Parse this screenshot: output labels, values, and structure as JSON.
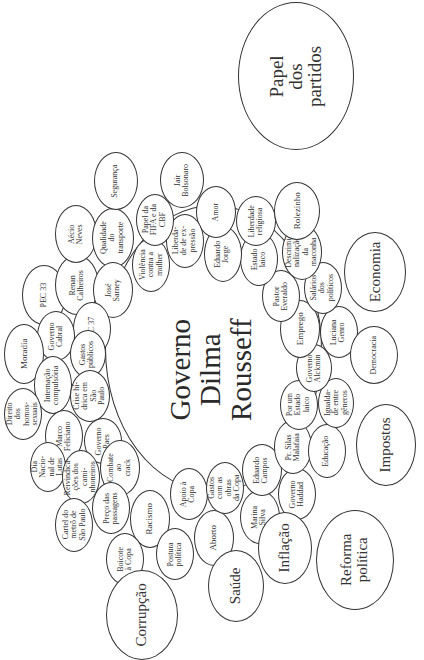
{
  "diagram": {
    "orientation": "rotated -90deg (text reads bottom to top)",
    "center": {
      "label": "Governo\nDilma Rousseff"
    },
    "inner_ring": [
      {
        "id": "pec33",
        "label": "PEC 33"
      },
      {
        "id": "renan",
        "label": "Renan\nCalheiros"
      },
      {
        "id": "aecio",
        "label": "Aécio\nNeves"
      },
      {
        "id": "qualidade",
        "label": "Qualidade do\ntransporte"
      },
      {
        "id": "seguranca",
        "label": "Segurança"
      },
      {
        "id": "jose-sarney",
        "label": "José\nSarney"
      },
      {
        "id": "pec37",
        "label": "PEC 37"
      },
      {
        "id": "governo-cabral",
        "label": "Governo\nCabral"
      },
      {
        "id": "moradia",
        "label": "Moradia"
      },
      {
        "id": "gastos-publicos",
        "label": "Gastos\npúblicos"
      },
      {
        "id": "internacao",
        "label": "Internação\ncompulsória"
      },
      {
        "id": "direito-homo",
        "label": "Direito\ndos homos-\nsexuais"
      },
      {
        "id": "crise-hidrica",
        "label": "Crise hí-\ndrica em São\nPaulo"
      },
      {
        "id": "marco-feliciano",
        "label": "Marco\nFeliciano"
      },
      {
        "id": "governo-paes",
        "label": "Governo\nPaes"
      },
      {
        "id": "dia-nacional",
        "label": "Dia Nacio-\nnal de Lutas"
      },
      {
        "id": "reivindicacoes",
        "label": "Reivindica-\nções dos cami-\nnhoneiros"
      },
      {
        "id": "combate-crack",
        "label": "Combate ao\ncrack"
      },
      {
        "id": "cartel-metro",
        "label": "Cartel do\nmetrô de\nSão Paulo"
      },
      {
        "id": "preco-passagens",
        "label": "Preço das\npassagens"
      },
      {
        "id": "racismo",
        "label": "Racismo"
      },
      {
        "id": "boicote-copa",
        "label": "Boicote\nà Copa"
      },
      {
        "id": "postura-politica",
        "label": "Postura\npolítica"
      },
      {
        "id": "apoio-copa",
        "label": "Apoio à\nCopa"
      },
      {
        "id": "aborto",
        "label": "Aborto"
      },
      {
        "id": "gastos-copa",
        "label": "Gastos\ncom as obras\nda Copa"
      },
      {
        "id": "marina-silva",
        "label": "Marina\nSilva"
      },
      {
        "id": "eduardo-campos",
        "label": "Eduardo\nCampos"
      },
      {
        "id": "governo-haddad",
        "label": "Governo\nHaddad"
      },
      {
        "id": "silas-malafaia",
        "label": "Pr. Silas\nMalafaia"
      },
      {
        "id": "educacao",
        "label": "Educação"
      },
      {
        "id": "estado-laico-1",
        "label": "Por um\nEstado\nlaico"
      },
      {
        "id": "igualdade",
        "label": "Igualda-\nde entre\ngêneros"
      },
      {
        "id": "governo-alckmin",
        "label": "Governo\nAlckmin"
      },
      {
        "id": "emprego",
        "label": "Emprego"
      },
      {
        "id": "luciana-genro",
        "label": "Luciana\nGenro"
      },
      {
        "id": "salarios",
        "label": "Salários\ndos políticos"
      },
      {
        "id": "pastor-everaldo",
        "label": "Pastor\nEveraldo"
      },
      {
        "id": "descriminalizacao",
        "label": "Descrimi-\nnalização da\nmaconha"
      },
      {
        "id": "estado-laico-2",
        "label": "Estado\nlaico"
      },
      {
        "id": "liberdade-religiosa",
        "label": "Liberdade\nreligiosa"
      },
      {
        "id": "eduardo-jorge",
        "label": "Eduardo\nJorge"
      },
      {
        "id": "amor",
        "label": "Amor"
      },
      {
        "id": "liberdade-expressao",
        "label": "Liberda-\nde de ex-\npressão"
      },
      {
        "id": "violencia-mulher",
        "label": "Violência\ncontra a\nmulher"
      },
      {
        "id": "papel-fifa",
        "label": "Papel da\nFIFA e da\nCBF"
      },
      {
        "id": "jair-bolsonaro",
        "label": "Jair\nBolsonaro"
      },
      {
        "id": "rolezinho",
        "label": "Rolezinho"
      }
    ],
    "outer_topics": [
      {
        "id": "papel-partidos",
        "label": "Papel\ndos\npartidos"
      },
      {
        "id": "economia",
        "label": "Economia"
      },
      {
        "id": "democracia",
        "label": "Democracia"
      },
      {
        "id": "impostos",
        "label": "Impostos"
      },
      {
        "id": "reforma-politica",
        "label": "Reforma\npolítica"
      },
      {
        "id": "inflacao",
        "label": "Inflação"
      },
      {
        "id": "saude",
        "label": "Saúde"
      },
      {
        "id": "corrupcao",
        "label": "Corrupção"
      }
    ]
  }
}
